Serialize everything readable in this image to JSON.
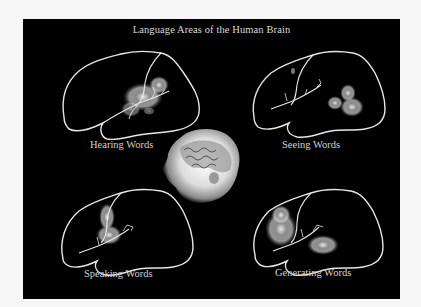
{
  "figure": {
    "title": "Language Areas of the Human Brain",
    "panels": [
      {
        "id": "hearing",
        "label": "Hearing Words"
      },
      {
        "id": "seeing",
        "label": "Seeing Words"
      },
      {
        "id": "speaking",
        "label": "Speaking Words"
      },
      {
        "id": "generating",
        "label": "Generating Words"
      }
    ],
    "center_image": "3d-head-with-brain-render",
    "colors": {
      "background": "#000000",
      "outline": "#e6e6e6",
      "activation": "#bfbfbf",
      "page": "#f6f6f6"
    }
  }
}
